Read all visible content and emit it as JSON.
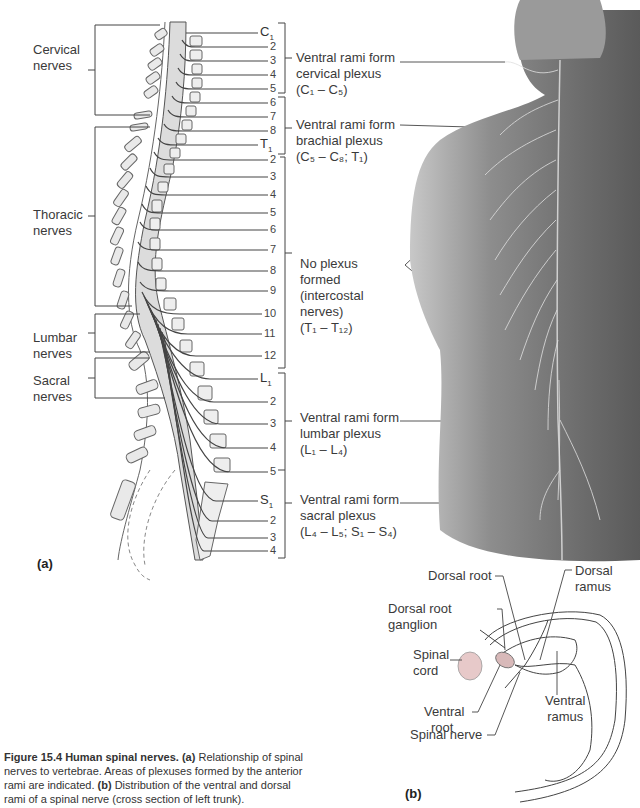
{
  "figure": {
    "number": "Figure 15.4",
    "title": "Human spinal nerves.",
    "caption_parts": [
      {
        "bold": "(a)",
        "text": " Relationship of spinal nerves to vertebrae. Areas of plexuses formed by the anterior rami are indicated. "
      },
      {
        "bold": "(b)",
        "text": " Distribution of the ventral and dorsal rami of a spinal nerve (cross section of left trunk)."
      }
    ]
  },
  "panel_a": {
    "label": "(a)",
    "regions": [
      {
        "name": "Cervical",
        "line2": "nerves"
      },
      {
        "name": "Thoracic",
        "line2": "nerves"
      },
      {
        "name": "Lumbar",
        "line2": "nerves"
      },
      {
        "name": "Sacral",
        "line2": "nerves"
      }
    ],
    "segments": [
      {
        "label": "C",
        "sub": "1",
        "y": 33
      },
      {
        "label": "2",
        "y": 47
      },
      {
        "label": "3",
        "y": 61
      },
      {
        "label": "4",
        "y": 75
      },
      {
        "label": "5",
        "y": 89
      },
      {
        "label": "6",
        "y": 103
      },
      {
        "label": "7",
        "y": 117
      },
      {
        "label": "8",
        "y": 131
      },
      {
        "label": "T",
        "sub": "1",
        "y": 145
      },
      {
        "label": "2",
        "y": 160
      },
      {
        "label": "3",
        "y": 177
      },
      {
        "label": "4",
        "y": 195
      },
      {
        "label": "5",
        "y": 213
      },
      {
        "label": "6",
        "y": 230
      },
      {
        "label": "7",
        "y": 250
      },
      {
        "label": "8",
        "y": 271
      },
      {
        "label": "9",
        "y": 291
      },
      {
        "label": "10",
        "y": 314
      },
      {
        "label": "11",
        "y": 334
      },
      {
        "label": "12",
        "y": 356
      },
      {
        "label": "L",
        "sub": "1",
        "y": 379
      },
      {
        "label": "2",
        "y": 402
      },
      {
        "label": "3",
        "y": 424
      },
      {
        "label": "4",
        "y": 448
      },
      {
        "label": "5",
        "y": 472
      },
      {
        "label": "S",
        "sub": "1",
        "y": 501
      },
      {
        "label": "2",
        "y": 521
      },
      {
        "label": "3",
        "y": 538
      },
      {
        "label": "4",
        "y": 551
      }
    ],
    "plexuses": [
      {
        "line1": "Ventral rami form",
        "line2": "cervical plexus",
        "range": "(C₁ – C₅)"
      },
      {
        "line1": "Ventral rami form",
        "line2": "brachial plexus",
        "range": "(C₅ – C₈; T₁)"
      },
      {
        "line1": "No plexus",
        "line2": "formed",
        "line3": "(intercostal",
        "line4": "nerves)",
        "range": "(T₁ – T₁₂)"
      },
      {
        "line1": "Ventral rami form",
        "line2": "lumbar plexus",
        "range": "(L₁ – L₄)"
      },
      {
        "line1": "Ventral rami form",
        "line2": "sacral plexus",
        "range": "(L₄ – L₅; S₁ – S₄)"
      }
    ]
  },
  "panel_b": {
    "label": "(b)",
    "labels": {
      "dorsal_root": "Dorsal root",
      "dorsal_root_ganglion_1": "Dorsal root",
      "dorsal_root_ganglion_2": "ganglion",
      "spinal_cord_1": "Spinal",
      "spinal_cord_2": "cord",
      "ventral_root_1": "Ventral",
      "ventral_root_2": "root",
      "spinal_nerve": "Spinal nerve",
      "dorsal_ramus_1": "Dorsal",
      "dorsal_ramus_2": "ramus",
      "ventral_ramus_1": "Ventral",
      "ventral_ramus_2": "ramus"
    }
  },
  "colors": {
    "line": "#444444",
    "bone_fill": "#e6e6e6",
    "cord_fill": "#d9d9d9",
    "skin_dark": "#6a6a6a",
    "skin_light": "#bdbdbd",
    "ganglion": "#c9a3a3"
  }
}
